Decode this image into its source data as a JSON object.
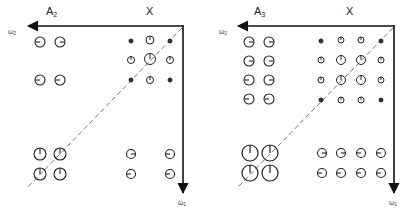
{
  "panels": [
    {
      "id": "left",
      "block_a_label": "A",
      "block_a_sub": "2",
      "block_x_label": "X",
      "axis_h_label": "ω",
      "axis_h_sub": "2",
      "axis_v_label": "ω",
      "axis_v_sub": "1"
    },
    {
      "id": "right",
      "block_a_label": "A",
      "block_a_sub": "3",
      "block_x_label": "X",
      "axis_h_label": "ω",
      "axis_h_sub": "2",
      "axis_v_label": "ω",
      "axis_v_sub": "1"
    }
  ],
  "colors": {
    "stroke": "#222222",
    "dashed": "#555555"
  }
}
